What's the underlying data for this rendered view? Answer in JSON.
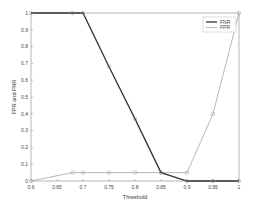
{
  "chart_data": {
    "type": "line",
    "title": "",
    "xlabel": "Threshold",
    "ylabel": "FPR and FNR",
    "xlim": [
      0.6,
      1.0
    ],
    "ylim": [
      0,
      1
    ],
    "grid": false,
    "legend_position": "upper right",
    "xticks": [
      "0.6",
      "0.65",
      "0.7",
      "0.75",
      "0.8",
      "0.85",
      "0.9",
      "0.95",
      "1"
    ],
    "yticks": [
      "0",
      "0.1",
      "0.2",
      "0.3",
      "0.4",
      "0.5",
      "0.6",
      "0.7",
      "0.8",
      "0.9",
      "1"
    ],
    "x": [
      0.6,
      0.68,
      0.7,
      0.75,
      0.8,
      0.85,
      0.9,
      0.95,
      1.0
    ],
    "series": [
      {
        "name": "FNR",
        "color": "#333333",
        "width": 1.3,
        "values": [
          1,
          1,
          1,
          0.68,
          0.37,
          0.05,
          0,
          0,
          0
        ]
      },
      {
        "name": "FPR",
        "color": "#999999",
        "width": 0.7,
        "values": [
          0,
          0.05,
          0.05,
          0.05,
          0.05,
          0.05,
          0.05,
          0.4,
          1
        ]
      }
    ]
  }
}
